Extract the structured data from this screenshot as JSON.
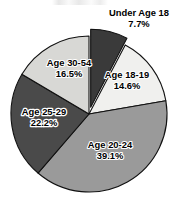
{
  "chart_data": {
    "type": "pie",
    "title": "",
    "subtitle": "",
    "xlabel": "",
    "ylabel": "",
    "legend_position": "none",
    "grid": false,
    "value_unit": "percent",
    "categories": [
      "Under Age 18",
      "Age 18-19",
      "Age 20-24",
      "Age 25-29",
      "Age 30-54"
    ],
    "values": [
      7.7,
      14.6,
      39.1,
      22.2,
      16.5
    ],
    "slices": [
      {
        "label": "Under Age 18",
        "value": 7.7,
        "value_label": "7.7%",
        "color": "#3a3a3a",
        "label_on_dark": true,
        "exploded": true,
        "label_x": 139,
        "label_y": 14,
        "value_x": 139,
        "value_y": 25
      },
      {
        "label": "Age 18-19",
        "value": 14.6,
        "value_label": "14.6%",
        "color": "#f0f0ee",
        "label_on_dark": false,
        "exploded": false,
        "label_x": 127,
        "label_y": 76,
        "value_x": 127,
        "value_y": 87
      },
      {
        "label": "Age 20-24",
        "value": 39.1,
        "value_label": "39.1%",
        "color": "#9a9a9a",
        "label_on_dark": false,
        "exploded": false,
        "label_x": 110,
        "label_y": 146,
        "value_x": 110,
        "value_y": 157
      },
      {
        "label": "Age 25-29",
        "value": 22.2,
        "value_label": "22.2%",
        "color": "#4a4a4a",
        "label_on_dark": true,
        "exploded": false,
        "label_x": 44,
        "label_y": 113,
        "value_x": 44,
        "value_y": 124
      },
      {
        "label": "Age 30-54",
        "value": 16.5,
        "value_label": "16.5%",
        "color": "#d8d8d5",
        "label_on_dark": false,
        "exploded": false,
        "label_x": 69,
        "label_y": 64,
        "value_x": 69,
        "value_y": 75
      }
    ],
    "geometry": {
      "center_x": 89,
      "center_y": 114,
      "radius": 78,
      "start_angle_deg": 0,
      "direction": "clockwise",
      "explode_offset": 7
    },
    "background_color": "#ffffff",
    "outline_color": "#111111"
  }
}
